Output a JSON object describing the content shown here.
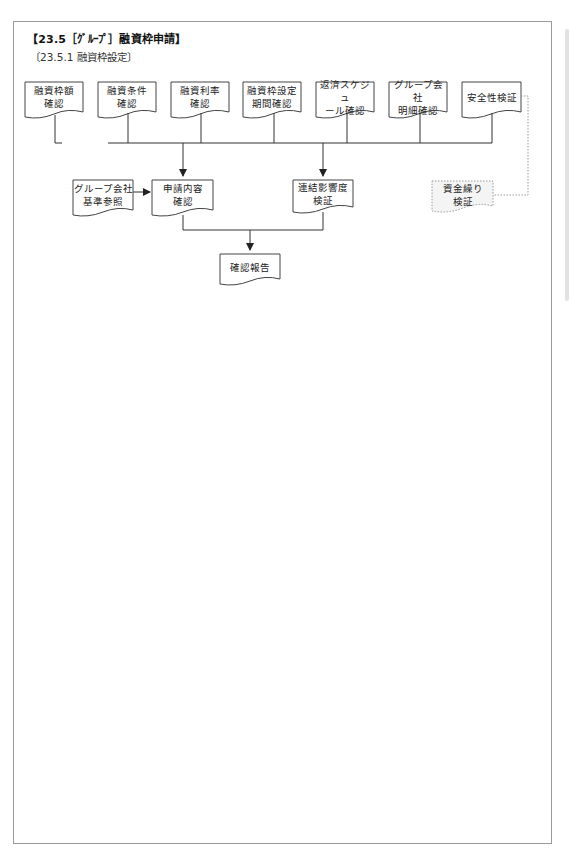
{
  "header": {
    "title": "【23.5［ｸﾞﾙｰﾌﾟ］融資枠申請】",
    "subtitle": "〔23.5.1  融資枠設定〕"
  },
  "diagram": {
    "type": "flowchart",
    "top_row": [
      {
        "id": "n1",
        "label": "融資枠額\n確認"
      },
      {
        "id": "n2",
        "label": "融資条件\n確認"
      },
      {
        "id": "n3",
        "label": "融資利率\n確認"
      },
      {
        "id": "n4",
        "label": "融資枠設定\n期間確認"
      },
      {
        "id": "n5",
        "label": "返済スケジュ\nール確認"
      },
      {
        "id": "n6",
        "label": "グループ会社\n明細確認"
      },
      {
        "id": "n7",
        "label": "安全性検証"
      }
    ],
    "middle_row": [
      {
        "id": "m0",
        "label": "グループ会社\n基準参照"
      },
      {
        "id": "m1",
        "label": "申請内容\n確認"
      },
      {
        "id": "m2",
        "label": "連結影響度\n検証"
      },
      {
        "id": "m3",
        "label": "資金繰り\n検証",
        "style": "dotted"
      }
    ],
    "bottom": {
      "id": "b1",
      "label": "確認報告"
    },
    "edges": [
      {
        "from": "top_row",
        "to": "m1"
      },
      {
        "from": "top_row",
        "to": "m2"
      },
      {
        "from": "m0",
        "to": "m1"
      },
      {
        "from": "m1",
        "to": "b1"
      },
      {
        "from": "m2",
        "to": "b1"
      },
      {
        "from": "n7",
        "to": "m3",
        "style": "dotted"
      }
    ],
    "colors": {
      "line": "#333333",
      "box_border": "#444444",
      "dotted": "#9a9a9a",
      "dotted_fill": "#f4f4f4",
      "frame": "#9a9a9a"
    }
  }
}
